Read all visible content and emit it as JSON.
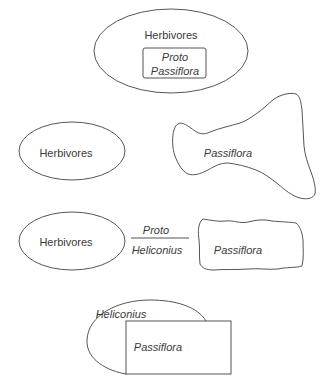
{
  "panels": [
    {
      "id": "panel-1",
      "herbivores_label": "Herbivores",
      "inner_box_line1": "Proto",
      "inner_box_line2": "Passiflora"
    },
    {
      "id": "panel-2",
      "herbivores_label": "Herbivores",
      "plant_label": "Passiflora"
    },
    {
      "id": "panel-3",
      "herbivores_label": "Herbivores",
      "link_top_label": "Proto",
      "link_bottom_label": "Heliconius",
      "plant_label": "Passiflora"
    },
    {
      "id": "panel-4",
      "ellipse_label": "Heliconius",
      "box_label": "Passiflora"
    }
  ],
  "colors": {
    "stroke": "#555555",
    "text": "#3a3a3a",
    "background": "#ffffff"
  }
}
